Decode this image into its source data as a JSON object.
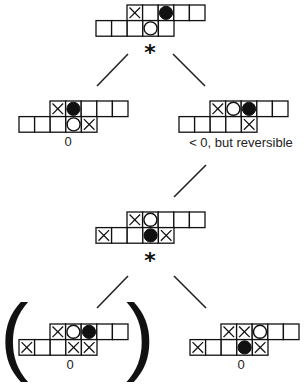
{
  "legend": {
    "X": "cross-marked cell",
    "O": "hollow circle stone",
    "B": "filled black stone",
    ".": "empty cell"
  },
  "boards": [
    {
      "id": "root",
      "top_row": [
        "X",
        ".",
        "B",
        ".",
        "."
      ],
      "bottom_row": [
        ".",
        ".",
        ".",
        "O",
        "."
      ],
      "label": "",
      "marker": "*"
    },
    {
      "id": "left-child",
      "top_row": [
        "X",
        "B",
        ".",
        ".",
        "."
      ],
      "bottom_row": [
        ".",
        ".",
        ".",
        "O",
        "X"
      ],
      "label": "0",
      "marker": ""
    },
    {
      "id": "right-child",
      "top_row": [
        "X",
        "O",
        "B",
        ".",
        "."
      ],
      "bottom_row": [
        ".",
        ".",
        ".",
        ".",
        "X"
      ],
      "label": "< 0, but reversible",
      "marker": ""
    },
    {
      "id": "reversed-position",
      "top_row": [
        "X",
        "O",
        ".",
        ".",
        "."
      ],
      "bottom_row": [
        "X",
        ".",
        ".",
        "B",
        "X"
      ],
      "label": "",
      "marker": "*"
    },
    {
      "id": "bottom-left",
      "top_row": [
        "X",
        "O",
        "B",
        ".",
        "."
      ],
      "bottom_row": [
        "X",
        ".",
        ".",
        "X",
        "X"
      ],
      "label": "0",
      "marker": "",
      "parenthesized": true
    },
    {
      "id": "bottom-right",
      "top_row": [
        "X",
        "X",
        "O",
        ".",
        "."
      ],
      "bottom_row": [
        "X",
        ".",
        ".",
        "B",
        "X"
      ],
      "label": "0",
      "marker": ""
    }
  ],
  "edges": [
    {
      "from": "root",
      "to": "left-child"
    },
    {
      "from": "root",
      "to": "right-child"
    },
    {
      "from": "right-child",
      "to": "reversed-position"
    },
    {
      "from": "reversed-position",
      "to": "bottom-left"
    },
    {
      "from": "reversed-position",
      "to": "bottom-right"
    }
  ],
  "parentheses": {
    "open": "(",
    "close": ")"
  }
}
